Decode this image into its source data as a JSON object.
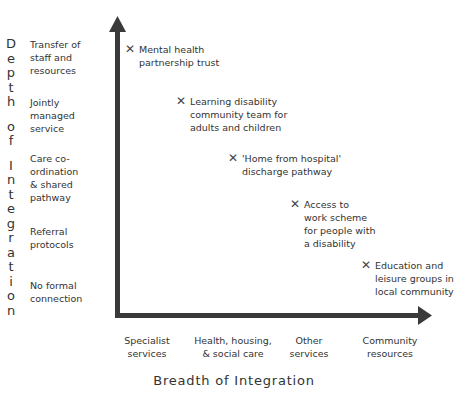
{
  "chart_data": {
    "type": "scatter",
    "title": "",
    "xlabel": "Breadth of Integration",
    "ylabel": "Depth of Integration",
    "x_categories": [
      "Specialist services",
      "Health, housing, & social care",
      "Other services",
      "Community resources"
    ],
    "y_categories": [
      "No formal connection",
      "Referral protocols",
      "Care co-ordination & shared pathway",
      "Jointly managed service",
      "Transfer of staff and resources"
    ],
    "points": [
      {
        "label": "Mental health partnership trust",
        "x": 0.05,
        "y": 4.5
      },
      {
        "label": "Learning disability community team for adults and children",
        "x": 0.9,
        "y": 3.6
      },
      {
        "label": "'Home from hospital' discharge pathway",
        "x": 1.6,
        "y": 2.7
      },
      {
        "label": "Access to work scheme for people with a disability",
        "x": 2.3,
        "y": 1.8
      },
      {
        "label": "Education and leisure groups in local community",
        "x": 3.1,
        "y": 0.9
      }
    ],
    "grid": false,
    "legend": null
  },
  "y_axis": {
    "title_lines": [
      "Depth",
      "of",
      "Integration"
    ],
    "ticks": [
      {
        "text": "Transfer of\nstaff and\nresources"
      },
      {
        "text": "Jointly\nmanaged\nservice"
      },
      {
        "text": "Care co-\nordination\n& shared\npathway"
      },
      {
        "text": "Referral\nprotocols"
      },
      {
        "text": "No formal\nconnection"
      }
    ]
  },
  "x_axis": {
    "title": "Breadth of Integration",
    "ticks": [
      {
        "text": "Specialist\nservices"
      },
      {
        "text": "Health, housing,\n& social care"
      },
      {
        "text": "Other\nservices"
      },
      {
        "text": "Community\nresources"
      }
    ]
  },
  "points": [
    {
      "mark": "✕",
      "text": "Mental health\npartnership trust"
    },
    {
      "mark": "✕",
      "text": "Learning disability\ncommunity team for\nadults and children"
    },
    {
      "mark": "✕",
      "text": "'Home from hospital'\ndischarge pathway"
    },
    {
      "mark": "✕",
      "text": "Access to\nwork scheme\nfor people with\na disability"
    },
    {
      "mark": "✕",
      "text": "Education and\nleisure groups in\nlocal community"
    }
  ],
  "colors": {
    "axis": "#3a3a3a",
    "text": "#333333",
    "background": "#ffffff"
  }
}
